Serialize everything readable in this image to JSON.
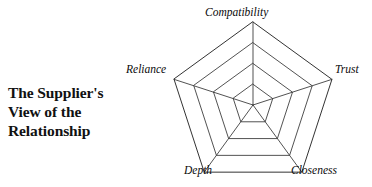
{
  "figure": {
    "title_lines": [
      "The Supplier's",
      "View of the",
      "Relationship"
    ],
    "line_color": "#333333",
    "background_color": "#ffffff"
  },
  "chart_data": {
    "type": "radar",
    "title": "The Supplier's View of the Relationship",
    "categories": [
      "Compatibility",
      "Trust",
      "Closeness",
      "Depth",
      "Reliance"
    ],
    "series": [],
    "rings": 4,
    "ring_fractions": [
      0.25,
      0.5,
      0.75,
      1.0
    ],
    "spokes": 5,
    "grid": true,
    "legend": false,
    "labels": {
      "compatibility": "Compatibility",
      "trust": "Trust",
      "closeness": "Closeness",
      "depth": "Depth",
      "reliance": "Reliance"
    }
  }
}
